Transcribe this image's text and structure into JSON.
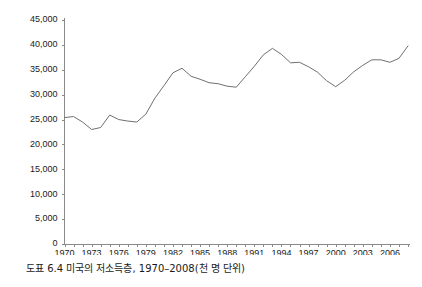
{
  "caption": "도표 6.4 미국의 저소득층, 1970–2008(천 명 단위)",
  "chart_data": {
    "type": "line",
    "title": "",
    "subtitle": "",
    "xlabel": "",
    "ylabel": "",
    "xlim": [
      1970,
      2008
    ],
    "ylim": [
      0,
      45000
    ],
    "ytick_step": 5000,
    "grid": false,
    "legend": false,
    "legend_position": "none",
    "line_color": "#707070",
    "axis_color": "#8a8a8a",
    "ytick_labels": [
      "0",
      "5,000",
      "10,000",
      "15,000",
      "20,000",
      "25,000",
      "30,000",
      "35,000",
      "40,000",
      "45,000"
    ],
    "ytick_values": [
      0,
      5000,
      10000,
      15000,
      20000,
      25000,
      30000,
      35000,
      40000,
      45000
    ],
    "xtick_labels": [
      "1970",
      "1973",
      "1976",
      "1979",
      "1982",
      "1985",
      "1988",
      "1991",
      "1994",
      "1997",
      "2000",
      "2003",
      "2006"
    ],
    "xtick_values": [
      1970,
      1973,
      1976,
      1979,
      1982,
      1985,
      1988,
      1991,
      1994,
      1997,
      2000,
      2003,
      2006
    ],
    "x": [
      1970,
      1971,
      1972,
      1973,
      1974,
      1975,
      1976,
      1977,
      1978,
      1979,
      1980,
      1981,
      1982,
      1983,
      1984,
      1985,
      1986,
      1987,
      1988,
      1989,
      1990,
      1991,
      1992,
      1993,
      1994,
      1995,
      1996,
      1997,
      1998,
      1999,
      2000,
      2001,
      2002,
      2003,
      2004,
      2005,
      2006,
      2007,
      2008
    ],
    "values": [
      25400,
      25600,
      24500,
      23000,
      23400,
      25900,
      25000,
      24700,
      24500,
      26100,
      29300,
      31800,
      34400,
      35300,
      33700,
      33100,
      32400,
      32200,
      31700,
      31500,
      33600,
      35700,
      38000,
      39300,
      38100,
      36400,
      36500,
      35600,
      34500,
      32800,
      31600,
      32900,
      34600,
      35900,
      37000,
      37000,
      36500,
      37300,
      39800
    ],
    "annotations": []
  }
}
